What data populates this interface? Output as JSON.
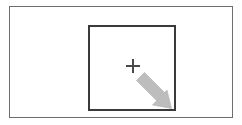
{
  "figure": {
    "title": "Selection resize illustration",
    "background_color": "#ffffff"
  },
  "outer_frame": {
    "name": "canvas-frame",
    "border_color": "#6e6e6e",
    "fill_color": "#ffffff",
    "border_width": "1px"
  },
  "selection_square": {
    "name": "selection-square",
    "border_color": "#3a3a3a",
    "fill_color": "transparent",
    "border_width": "2px"
  },
  "crosshair": {
    "name": "crosshair-marker",
    "glyph": "plus-icon",
    "color": "#4a4a4a",
    "size": "14"
  },
  "resize_arrow": {
    "name": "resize-arrow-icon",
    "direction": "down-right",
    "fill_color": "#bdbdbd",
    "stroke_color": "#b0b0b0"
  }
}
